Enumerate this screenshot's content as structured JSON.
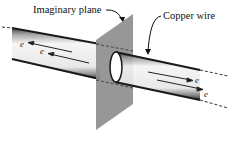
{
  "diagram": {
    "labels": {
      "plane": "Imaginary plane",
      "wire": "Copper wire"
    },
    "electron_symbol": "e",
    "left_electrons": [
      "e",
      "e"
    ],
    "right_electrons": [
      "e",
      "e"
    ],
    "colors": {
      "plane": "#8e8e8e",
      "wire_edge": "#1a1a1a",
      "wire_fill": "#f2f2f2",
      "arrow": "#222222"
    }
  }
}
